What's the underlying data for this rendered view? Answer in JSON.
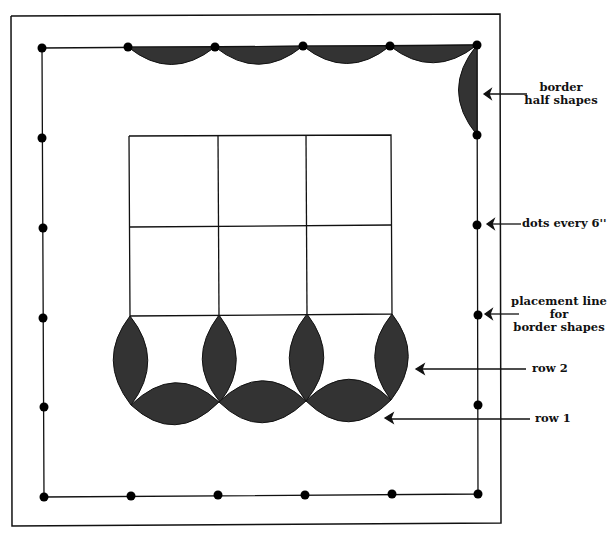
{
  "diagram": {
    "colors": {
      "fill": "#333333",
      "line": "#111111",
      "background": "#ffffff"
    },
    "labels": {
      "border_half_shapes": [
        "border",
        "half shapes"
      ],
      "dots_every": "dots every 6''",
      "placement_line": [
        "placement line",
        "for",
        "border shapes"
      ],
      "row2": "row 2",
      "row1": "row 1"
    }
  }
}
